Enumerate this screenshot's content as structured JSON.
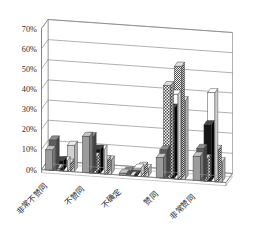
{
  "chart_data": {
    "type": "bar",
    "title": "",
    "subtitle": "",
    "xlabel": "",
    "ylabel": "",
    "ylim": [
      0,
      0.7
    ],
    "grid": true,
    "legend_position": "none",
    "orientation": "vertical-3d",
    "tick_labels": [
      "0%",
      "10%",
      "20%",
      "30%",
      "40%",
      "50%",
      "60%",
      "70%"
    ],
    "tick_values": [
      0,
      0.1,
      0.2,
      0.3,
      0.4,
      0.5,
      0.6,
      0.7
    ],
    "categories": [
      "非常不赞同",
      "不赞同",
      "不确定",
      "赞同",
      "非常赞同"
    ],
    "series": [
      {
        "name": "系列1",
        "fill": "solid-gray",
        "values": [
          0.1,
          0.18,
          0.01,
          0.1,
          0.12
        ]
      },
      {
        "name": "系列2",
        "fill": "dark-gray",
        "values": [
          0.15,
          0.18,
          0.02,
          0.14,
          0.16
        ]
      },
      {
        "name": "系列3",
        "fill": "checker",
        "values": [
          0.01,
          0.08,
          0.0,
          0.46,
          0.11
        ]
      },
      {
        "name": "系列4",
        "fill": "black",
        "values": [
          0.05,
          0.12,
          0.01,
          0.35,
          0.28
        ]
      },
      {
        "name": "系列5",
        "fill": "white",
        "values": [
          0.05,
          0.12,
          0.04,
          0.42,
          0.44
        ]
      },
      {
        "name": "系列6",
        "fill": "dense-dot",
        "values": [
          0.04,
          0.07,
          0.05,
          0.56,
          0.16
        ]
      },
      {
        "name": "系列7",
        "fill": "light-gray",
        "values": [
          0.13,
          0.07,
          0.04,
          0.39,
          0.1
        ]
      }
    ]
  }
}
